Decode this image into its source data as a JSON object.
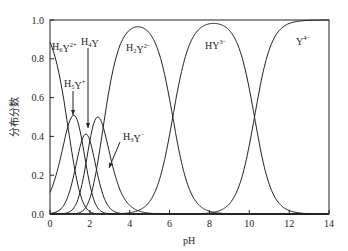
{
  "chart_data": {
    "type": "line",
    "title": "",
    "xlabel": "pH",
    "ylabel": "分布分数",
    "xlim": [
      0,
      14
    ],
    "ylim": [
      0,
      1.0
    ],
    "grid": false,
    "legend": "inline labels",
    "x_ticks": [
      "0",
      "2",
      "4",
      "6",
      "8",
      "10",
      "12",
      "14"
    ],
    "y_ticks": [
      "0.0",
      "0.2",
      "0.4",
      "0.6",
      "0.8",
      "1.0"
    ],
    "pKa": [
      0.9,
      1.6,
      2.0,
      2.67,
      6.16,
      10.26
    ],
    "x": [
      0,
      1,
      2,
      3,
      4,
      5,
      6,
      7,
      8,
      9,
      10,
      11,
      12,
      13,
      14
    ],
    "series": [
      {
        "name": "H6Y2+",
        "label_main": "H",
        "label_sub": "6",
        "label_rest": "Y",
        "label_sup": "2+",
        "values": [
          0.88,
          0.42,
          0.04,
          0.0,
          0.0,
          0.0,
          0.0,
          0.0,
          0.0,
          0.0,
          0.0,
          0.0,
          0.0,
          0.0,
          0.0
        ]
      },
      {
        "name": "H5Y+",
        "label_main": "H",
        "label_sub": "5",
        "label_rest": "Y",
        "label_sup": "+",
        "values": [
          0.11,
          0.47,
          0.32,
          0.03,
          0.0,
          0.0,
          0.0,
          0.0,
          0.0,
          0.0,
          0.0,
          0.0,
          0.0,
          0.0,
          0.0
        ]
      },
      {
        "name": "H4Y",
        "label_main": "H",
        "label_sub": "4",
        "label_rest": "Y",
        "label_sup": "",
        "values": [
          0.01,
          0.09,
          0.39,
          0.26,
          0.02,
          0.0,
          0.0,
          0.0,
          0.0,
          0.0,
          0.0,
          0.0,
          0.0,
          0.0,
          0.0
        ]
      },
      {
        "name": "H3Y-",
        "label_main": "H",
        "label_sub": "3",
        "label_rest": "Y",
        "label_sup": "−",
        "values": [
          0.0,
          0.02,
          0.25,
          0.5,
          0.34,
          0.05,
          0.0,
          0.0,
          0.0,
          0.0,
          0.0,
          0.0,
          0.0,
          0.0,
          0.0
        ]
      },
      {
        "name": "H2Y2-",
        "label_main": "H",
        "label_sub": "2",
        "label_rest": "Y",
        "label_sup": "2−",
        "values": [
          0.0,
          0.0,
          0.0,
          0.21,
          0.64,
          0.93,
          0.59,
          0.13,
          0.01,
          0.0,
          0.0,
          0.0,
          0.0,
          0.0,
          0.0
        ]
      },
      {
        "name": "HY3-",
        "label_main": "H",
        "label_sub": "",
        "label_rest": "Y",
        "label_sup": "3−",
        "values": [
          0.0,
          0.0,
          0.0,
          0.0,
          0.0,
          0.01,
          0.41,
          0.87,
          0.98,
          0.94,
          0.65,
          0.15,
          0.02,
          0.0,
          0.0
        ]
      },
      {
        "name": "Y4-",
        "label_main": "",
        "label_sub": "",
        "label_rest": "Y",
        "label_sup": "4−",
        "values": [
          0.0,
          0.0,
          0.0,
          0.0,
          0.0,
          0.0,
          0.0,
          0.0,
          0.01,
          0.05,
          0.35,
          0.85,
          0.98,
          1.0,
          1.0
        ]
      }
    ],
    "annotations": [
      {
        "text": "H6Y2+",
        "type": "label",
        "x": 0.1,
        "y": 0.87
      },
      {
        "text": "H4Y",
        "type": "arrow-label",
        "arrow_to_x": 1.8,
        "arrow_to_y": 0.4
      },
      {
        "text": "H5Y+",
        "type": "arrow-label",
        "arrow_to_x": 1.2,
        "arrow_to_y": 0.5
      },
      {
        "text": "H3Y-",
        "type": "arrow-label",
        "arrow_to_x": 3.2,
        "arrow_to_y": 0.35
      },
      {
        "text": "H2Y2-",
        "type": "label",
        "x": 4.4,
        "y": 0.88
      },
      {
        "text": "HY3-",
        "type": "label",
        "x": 8.1,
        "y": 0.9
      },
      {
        "text": "Y4-",
        "type": "label",
        "x": 12.8,
        "y": 0.93
      }
    ]
  }
}
